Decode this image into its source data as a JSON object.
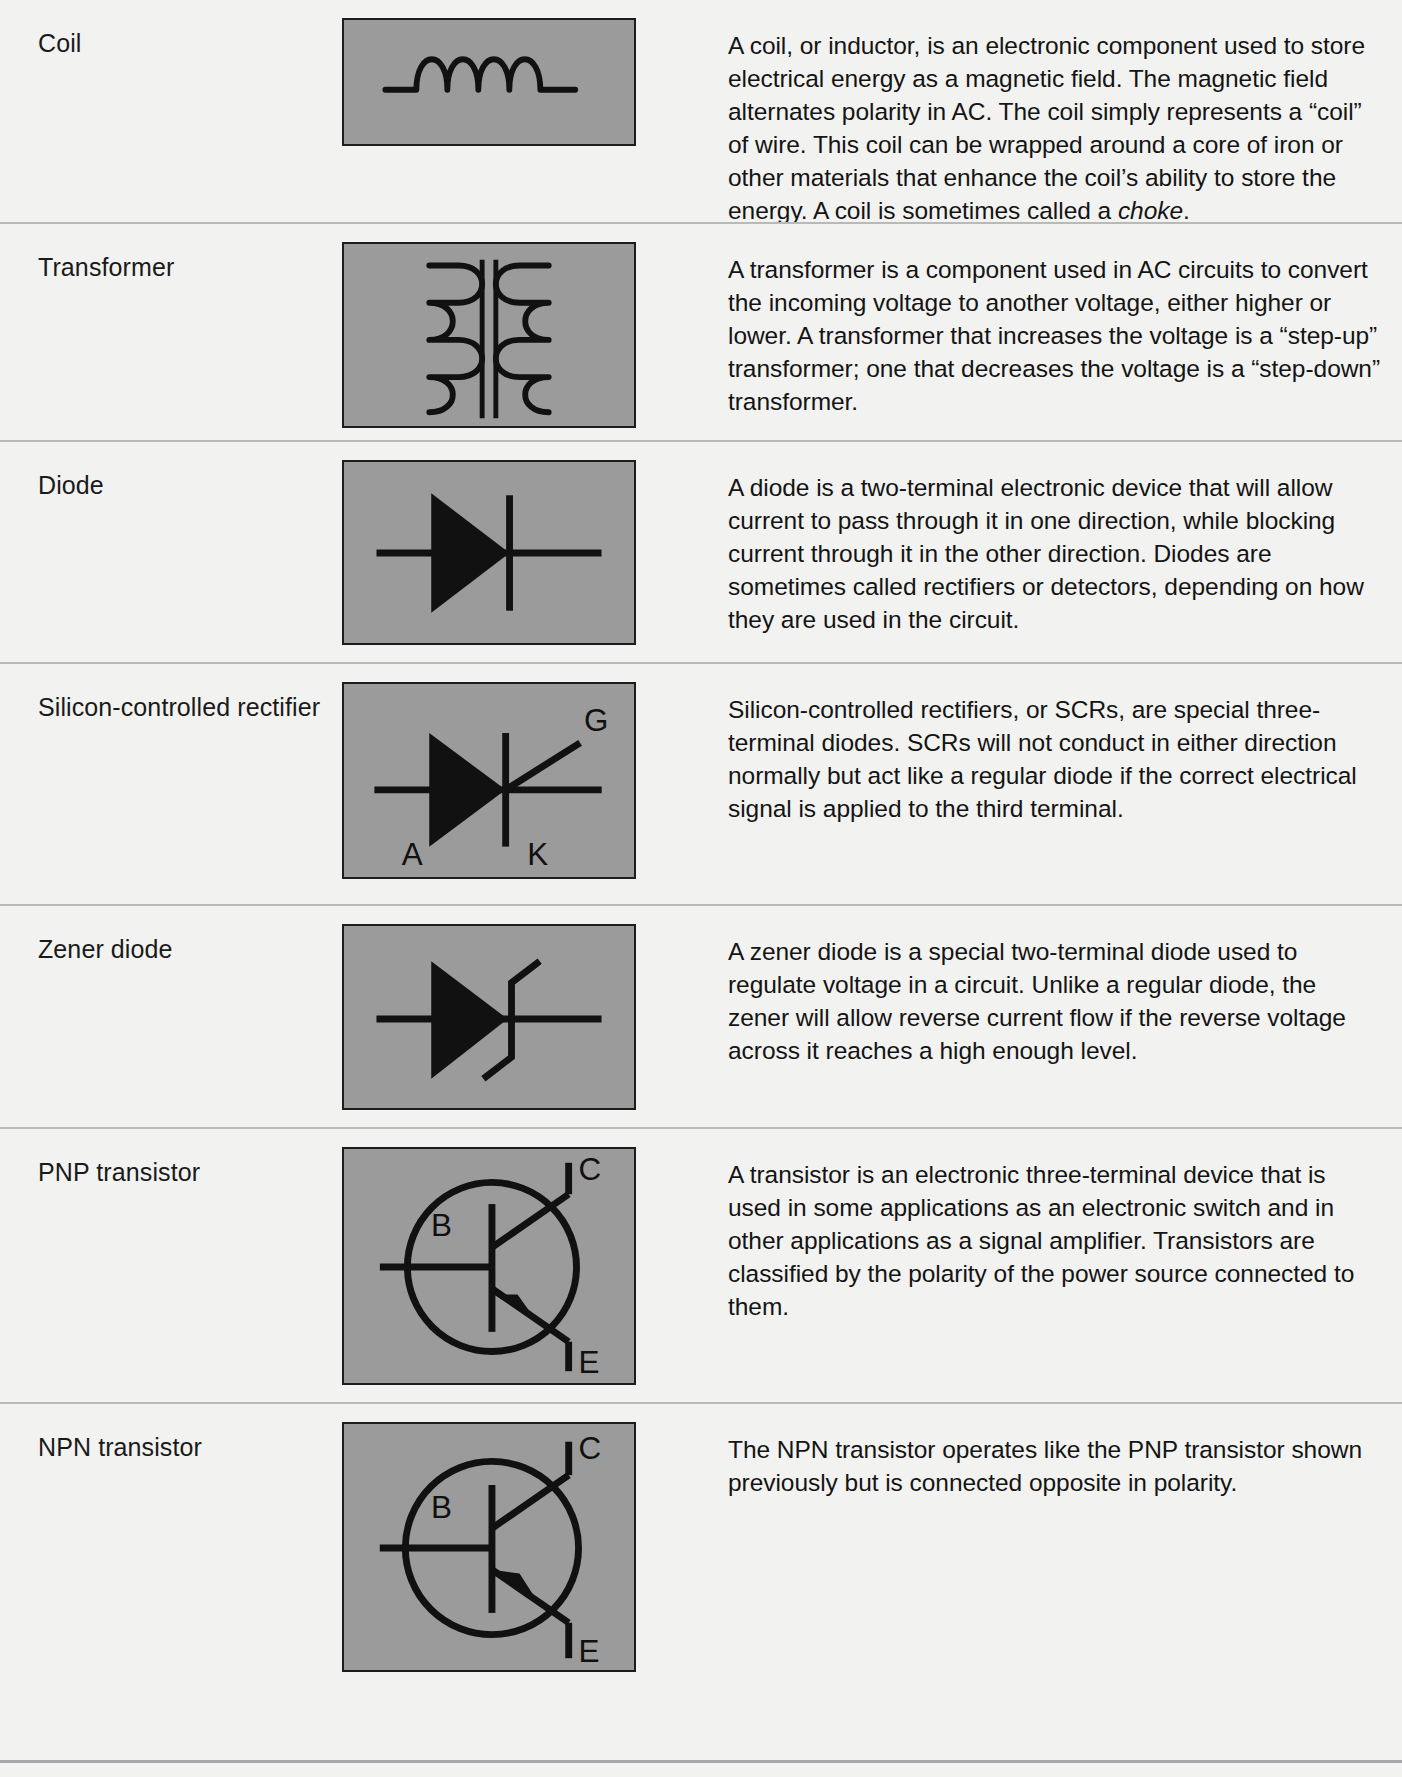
{
  "document": {
    "type": "reference-table",
    "title": "Electronic component schematic symbols",
    "columns": [
      "Component name",
      "Schematic symbol",
      "Description"
    ],
    "colors": {
      "page_background": "#f2f2f0",
      "symbol_box_fill": "#9b9b9b",
      "symbol_box_border": "#1d1d1d",
      "rule": "#b9b9ba",
      "text": "#141414"
    }
  },
  "rows": [
    {
      "name": "Coil",
      "symbol": "coil-inductor-symbol",
      "symbol_labels": [],
      "description_html": "A coil, or inductor, is an electronic component used to store electrical energy as a magnetic field. The magnetic field alternates polarity in AC. The coil simply represents a “coil” of wire. This coil can be wrapped around a core of iron or other materials that enhance the coil’s ability to store the energy. A coil is sometimes called a <em>choke</em>.",
      "description": "A coil, or inductor, is an electronic component used to store electrical energy as a magnetic field. The magnetic field alternates polarity in AC. The coil simply represents a “coil” of wire. This coil can be wrapped around a core of iron or other materials that enhance the coil’s ability to store the energy. A coil is sometimes called a choke."
    },
    {
      "name": "Transformer",
      "symbol": "transformer-symbol",
      "symbol_labels": [],
      "description_html": "A transformer is a component used in AC circuits to convert the incoming voltage to another voltage, either higher or lower. A transformer that increases the voltage is a “step-up” transformer; one that decreases the voltage is a “step-down” transformer.",
      "description": "A transformer is a component used in AC circuits to convert the incoming voltage to another voltage, either higher or lower. A transformer that increases the voltage is a “step-up” transformer; one that decreases the voltage is a “step-down” transformer."
    },
    {
      "name": "Diode",
      "symbol": "diode-symbol",
      "symbol_labels": [],
      "description_html": "A diode is a two-terminal electronic device that will allow current to pass through it in one direction, while blocking current through it in the other direction. Diodes are sometimes called rectifiers or detectors, depending on how they are used in the circuit.",
      "description": "A diode is a two-terminal electronic device that will allow current to pass through it in one direction, while blocking current through it in the other direction. Diodes are sometimes called rectifiers or detectors, depending on how they are used in the circuit."
    },
    {
      "name": "Silicon-controlled rectifier",
      "symbol": "scr-symbol",
      "symbol_labels": [
        "A",
        "G",
        "K"
      ],
      "description_html": "Silicon-controlled rectifiers, or SCRs, are special three-terminal diodes. SCRs will not conduct in either direction normally but act like a regular diode if the correct electrical signal is applied to the third terminal.",
      "description": "Silicon-controlled rectifiers, or SCRs, are special three-terminal diodes. SCRs will not conduct in either direction normally but act like a regular diode if the correct electrical signal is applied to the third terminal."
    },
    {
      "name": "Zener diode",
      "symbol": "zener-diode-symbol",
      "symbol_labels": [],
      "description_html": "A zener diode is a special two-terminal diode used to regulate voltage in a circuit. Unlike a regular diode, the zener will allow reverse current flow if the reverse voltage across it reaches a high enough level.",
      "description": "A zener diode is a special two-terminal diode used to regulate voltage in a circuit. Unlike a regular diode, the zener will allow reverse current flow if the reverse voltage across it reaches a high enough level."
    },
    {
      "name": "PNP transistor",
      "symbol": "pnp-transistor-symbol",
      "symbol_labels": [
        "B",
        "C",
        "E"
      ],
      "description_html": "A transistor is an electronic three-terminal device that is used in some applications as an electronic switch and in other applications as a signal amplifier. Transistors are classified by the polarity of the power source connected to them.",
      "description": "A transistor is an electronic three-terminal device that is used in some applications as an electronic switch and in other applications as a signal amplifier. Transistors are classified by the polarity of the power source connected to them."
    },
    {
      "name": "NPN transistor",
      "symbol": "npn-transistor-symbol",
      "symbol_labels": [
        "B",
        "C",
        "E"
      ],
      "description_html": "The NPN transistor operates like the PNP transistor shown previously but is connected opposite in polarity.",
      "description": "The NPN transistor operates like the PNP transistor shown previously but is connected opposite in polarity."
    }
  ],
  "symbol_labels": {
    "scr_anode": "A",
    "scr_gate": "G",
    "scr_cathode": "K",
    "bjt_base": "B",
    "bjt_collector": "C",
    "bjt_emitter": "E"
  }
}
